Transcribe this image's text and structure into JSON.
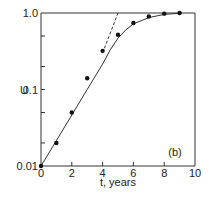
{
  "chart_data": {
    "type": "line",
    "title": "",
    "panel_label": "(b)",
    "xlabel": "t, years",
    "ylabel": "U",
    "xlim": [
      0,
      10
    ],
    "ylim": [
      0.01,
      1.0
    ],
    "yscale": "log",
    "x_ticks": [
      "0",
      "2",
      "4",
      "6",
      "8",
      "10"
    ],
    "y_tick_labels": [
      "1.0",
      "0.1",
      "0.01"
    ],
    "grid": false,
    "legend": null,
    "series": [
      {
        "name": "measured",
        "style": "markers",
        "x": [
          0,
          1,
          2,
          3,
          4,
          5,
          6,
          7,
          8,
          9
        ],
        "values": [
          0.01,
          0.02,
          0.05,
          0.14,
          0.32,
          0.52,
          0.74,
          0.9,
          0.98,
          1.0
        ]
      },
      {
        "name": "fit curve",
        "style": "solid",
        "x": [
          0,
          1,
          2,
          3,
          4,
          4.5,
          5,
          5.5,
          6,
          7,
          8,
          9
        ],
        "values": [
          0.01,
          0.0215,
          0.0464,
          0.1,
          0.215,
          0.33,
          0.47,
          0.6,
          0.72,
          0.87,
          0.96,
          0.99
        ]
      },
      {
        "name": "exponential extrapolation",
        "style": "dashed",
        "x": [
          4,
          5
        ],
        "values": [
          0.3,
          1.0
        ]
      }
    ]
  }
}
